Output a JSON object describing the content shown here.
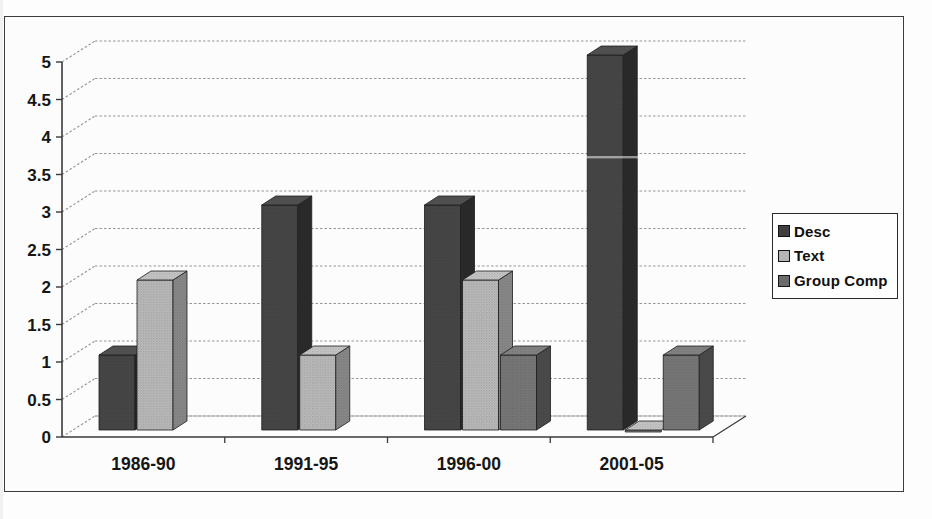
{
  "chart_data": {
    "type": "bar",
    "projection": "3d",
    "title": "",
    "xlabel": "",
    "ylabel": "",
    "categories": [
      "1986-90",
      "1991-95",
      "1996-00",
      "2001-05"
    ],
    "series": [
      {
        "name": "Desc",
        "values": [
          1,
          3,
          3,
          5
        ],
        "fill": "#4a4a4a",
        "side": "#2d2d2d",
        "top": "#565656",
        "swatch": "#3f3f3f"
      },
      {
        "name": "Text",
        "values": [
          2,
          1,
          2,
          0
        ],
        "fill": "#c2c2c2",
        "side": "#8f8f8f",
        "top": "#cfcfcf",
        "swatch": "#b5b5b5"
      },
      {
        "name": "Group Comp",
        "values": [
          null,
          null,
          1,
          1
        ],
        "fill": "#7d7d7d",
        "side": "#4f4f4f",
        "top": "#8a8a8a",
        "swatch": "#6b6b6b"
      }
    ],
    "y_ticks": [
      0,
      0.5,
      1,
      1.5,
      2,
      2.5,
      3,
      3.5,
      4,
      4.5,
      5
    ],
    "y_tick_labels": [
      "0",
      "0.5",
      "1",
      "1.5",
      "2",
      "2.5",
      "3",
      "3.5",
      "4",
      "4.5",
      "5"
    ],
    "ylim": [
      0,
      5
    ],
    "grid": true,
    "legend_position": "right",
    "colors": {
      "axis": "#3a3a3a",
      "grid": "#969696",
      "text": "#161616",
      "floor_edge": "#ababab",
      "frame": "#3c3c3c",
      "background": "#fdfdfd"
    }
  }
}
